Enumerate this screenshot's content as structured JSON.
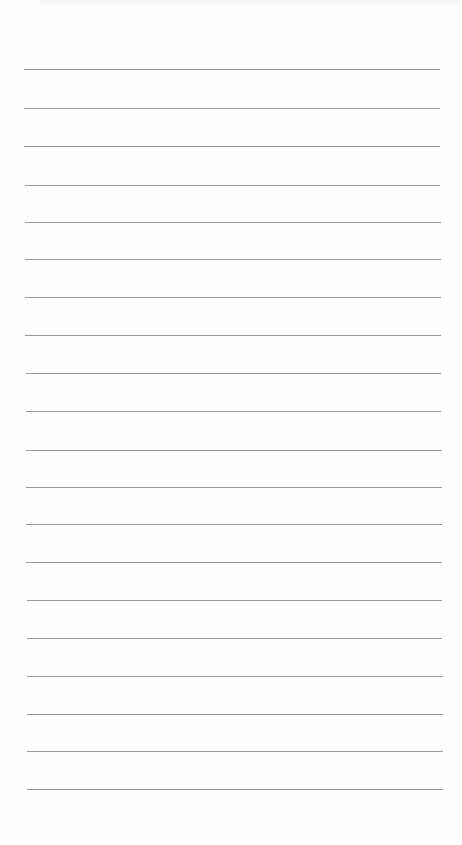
{
  "document": {
    "type": "lined-paper",
    "background_color": "#fefefe",
    "rule_color": "#8e8e8e",
    "rule_count": 20,
    "rules": [
      {
        "y": 69,
        "x1": 24,
        "x2": 440
      },
      {
        "y": 108,
        "x1": 24,
        "x2": 440
      },
      {
        "y": 146,
        "x1": 24,
        "x2": 440
      },
      {
        "y": 185,
        "x1": 25,
        "x2": 440
      },
      {
        "y": 222,
        "x1": 25,
        "x2": 441
      },
      {
        "y": 259,
        "x1": 25,
        "x2": 441
      },
      {
        "y": 297,
        "x1": 25,
        "x2": 441
      },
      {
        "y": 335,
        "x1": 25,
        "x2": 441
      },
      {
        "y": 373,
        "x1": 26,
        "x2": 441
      },
      {
        "y": 411,
        "x1": 26,
        "x2": 441
      },
      {
        "y": 450,
        "x1": 26,
        "x2": 442
      },
      {
        "y": 487,
        "x1": 26,
        "x2": 442
      },
      {
        "y": 524,
        "x1": 26,
        "x2": 442
      },
      {
        "y": 562,
        "x1": 26,
        "x2": 442
      },
      {
        "y": 600,
        "x1": 27,
        "x2": 442
      },
      {
        "y": 638,
        "x1": 27,
        "x2": 442
      },
      {
        "y": 676,
        "x1": 27,
        "x2": 443
      },
      {
        "y": 714,
        "x1": 27,
        "x2": 443
      },
      {
        "y": 751,
        "x1": 27,
        "x2": 443
      },
      {
        "y": 789,
        "x1": 27,
        "x2": 443
      }
    ]
  }
}
